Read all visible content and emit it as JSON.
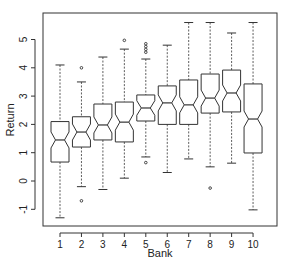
{
  "chart_data": {
    "type": "boxplot",
    "notched": true,
    "title": "",
    "xlabel": "Bank",
    "ylabel": "Return",
    "categories": [
      "1",
      "2",
      "3",
      "4",
      "5",
      "6",
      "7",
      "8",
      "9",
      "10"
    ],
    "ylim": [
      -1.6,
      5.9
    ],
    "yticks": [
      -1,
      0,
      1,
      2,
      3,
      4,
      5
    ],
    "grid": false,
    "legend": null,
    "boxes": [
      {
        "label": "1",
        "whisker_low": -1.3,
        "q1": 0.67,
        "median": 1.45,
        "q3": 2.1,
        "whisker_high": 4.1,
        "outliers": []
      },
      {
        "label": "2",
        "whisker_low": -0.2,
        "q1": 1.2,
        "median": 1.73,
        "q3": 2.27,
        "whisker_high": 3.5,
        "outliers": [
          4.0,
          -0.7
        ]
      },
      {
        "label": "3",
        "whisker_low": -0.3,
        "q1": 1.45,
        "median": 1.98,
        "q3": 2.72,
        "whisker_high": 4.38,
        "outliers": []
      },
      {
        "label": "4",
        "whisker_low": 0.1,
        "q1": 1.38,
        "median": 2.08,
        "q3": 2.79,
        "whisker_high": 4.66,
        "outliers": [
          4.97
        ]
      },
      {
        "label": "5",
        "whisker_low": 0.85,
        "q1": 2.12,
        "median": 2.58,
        "q3": 3.04,
        "whisker_high": 4.31,
        "outliers": [
          4.55,
          4.65,
          4.75,
          4.85,
          0.65
        ]
      },
      {
        "label": "6",
        "whisker_low": 0.3,
        "q1": 2.0,
        "median": 2.76,
        "q3": 3.36,
        "whisker_high": 4.8,
        "outliers": []
      },
      {
        "label": "7",
        "whisker_low": 0.78,
        "q1": 2.0,
        "median": 2.69,
        "q3": 3.57,
        "whisker_high": 5.6,
        "outliers": []
      },
      {
        "label": "8",
        "whisker_low": 0.5,
        "q1": 2.4,
        "median": 2.93,
        "q3": 3.78,
        "whisker_high": 5.6,
        "outliers": [
          -0.25
        ]
      },
      {
        "label": "9",
        "whisker_low": 0.63,
        "q1": 2.44,
        "median": 3.11,
        "q3": 3.92,
        "whisker_high": 5.23,
        "outliers": []
      },
      {
        "label": "10",
        "whisker_low": -1.02,
        "q1": 0.99,
        "median": 2.19,
        "q3": 3.43,
        "whisker_high": 5.6,
        "outliers": []
      }
    ]
  },
  "style": {
    "line_color": "#333333",
    "frame_color": "#333333",
    "background": "#ffffff"
  }
}
